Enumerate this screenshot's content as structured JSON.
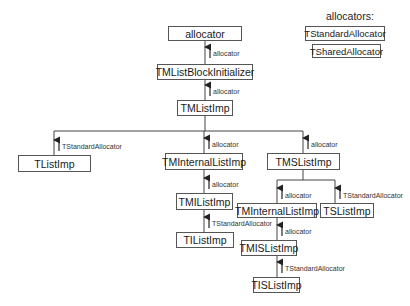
{
  "legend": {
    "title": "allocators:",
    "items": [
      "TStandardAllocator",
      "TSharedAllocator"
    ]
  },
  "nodes": {
    "allocator": "allocator",
    "block_init": "TMListBlockInitializer",
    "tmlistimp": "TMListImp",
    "tlistimp": "TListImp",
    "tminternal_mid": "TMInternalListImp",
    "tmslistimp": "TMSListImp",
    "tmilistimp": "TMIListImp",
    "tilistimp": "TIListImp",
    "tminternal_right": "TMInternalListImp",
    "tslistimp": "TSListImp",
    "tmislistimp": "TMISListImp",
    "tislistimp": "TISListImp"
  },
  "edges": {
    "e_alloc_block": "allocator",
    "e_block_tml": "allocator",
    "e_tml_tlist": "TStandardAllocator",
    "e_tml_tmint": "allocator",
    "e_tml_tms": "allocator",
    "e_tmint_tmi": "allocator",
    "e_tmi_ti": "TStandardAllocator",
    "e_tms_tmint2": "allocator",
    "e_tms_ts": "TStandardAllocator",
    "e_tmint2_tmis": "allocator",
    "e_tmis_tis": "TStandardAllocator"
  }
}
